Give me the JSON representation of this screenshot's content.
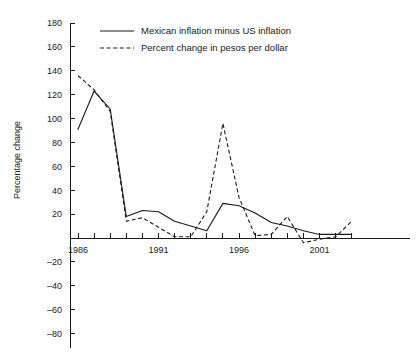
{
  "chart_data": {
    "type": "line",
    "title": "",
    "xlabel": "",
    "ylabel": "Percentage change",
    "xlim": [
      1986,
      2003
    ],
    "ylim": [
      -90,
      180
    ],
    "grid": false,
    "legend_position": "top-center",
    "x_ticks": [
      1986,
      1987,
      1988,
      1989,
      1990,
      1991,
      1992,
      1993,
      1994,
      1995,
      1996,
      1997,
      1998,
      1999,
      2000,
      2001,
      2002,
      2003
    ],
    "x_tick_labels": [
      "1986",
      "",
      "",
      "",
      "",
      "1991",
      "",
      "",
      "",
      "",
      "1996",
      "",
      "",
      "",
      "",
      "2001",
      "",
      ""
    ],
    "y_ticks": [
      -80,
      -60,
      -40,
      -20,
      0,
      20,
      40,
      60,
      80,
      100,
      120,
      140,
      160,
      180
    ],
    "y_tick_labels": [
      "–80",
      "–60",
      "–40",
      "–20",
      "",
      "20",
      "40",
      "60",
      "80",
      "100",
      "120",
      "140",
      "160",
      "180"
    ],
    "colors": {
      "axis": "#1a1a1a",
      "series_1": "#1a1a1a",
      "series_2": "#1a1a1a",
      "background": "#ffffff"
    },
    "x": [
      1986,
      1987,
      1988,
      1989,
      1990,
      1991,
      1992,
      1993,
      1994,
      1995,
      1996,
      1997,
      1998,
      1999,
      2000,
      2001,
      2002,
      2003
    ],
    "series": [
      {
        "name": "Mexican inflation minus US inflation",
        "style": "solid",
        "values": [
          91,
          123,
          108,
          18,
          23,
          22,
          14,
          10,
          6,
          29,
          27,
          21,
          13,
          10,
          6,
          3,
          3,
          3
        ]
      },
      {
        "name": "Percent change in pesos per dollar",
        "style": "dashed",
        "values": [
          136,
          124,
          106,
          14,
          17,
          9,
          1,
          1,
          22,
          96,
          34,
          2,
          3,
          18,
          -4,
          -1,
          1,
          14
        ]
      }
    ]
  },
  "legend": {
    "entries": [
      {
        "label": "Mexican inflation minus US inflation",
        "style": "solid"
      },
      {
        "label": "Percent change in pesos per dollar",
        "style": "dashed"
      }
    ]
  },
  "axes": {
    "y_title": "Percentage change"
  }
}
